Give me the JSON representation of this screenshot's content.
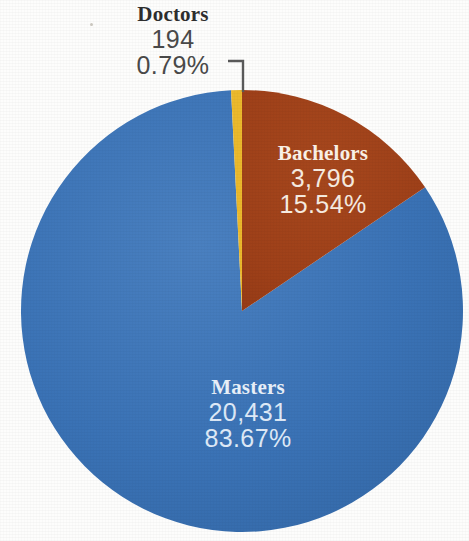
{
  "chart_data": {
    "type": "pie",
    "title": "",
    "subtitle": "",
    "xlabel": "",
    "ylabel": "",
    "legend_position": "none",
    "grid": false,
    "total": 24421,
    "start_angle_deg": 0,
    "direction": "clockwise",
    "categories": [
      "Bachelors",
      "Masters",
      "Doctors"
    ],
    "values": [
      3796,
      20431,
      194
    ],
    "percentages": [
      15.54,
      83.67,
      0.79
    ],
    "colors": [
      "#9e4019",
      "#3a72b5",
      "#ebb92c"
    ],
    "slices": [
      {
        "name": "Bachelors",
        "value": 3796,
        "value_text": "3,796",
        "percent": 15.54,
        "percent_text": "15.54%",
        "color": "#9e4019",
        "label_placement": "inside",
        "label_color": "#fbf2e8"
      },
      {
        "name": "Masters",
        "value": 20431,
        "value_text": "20,431",
        "percent": 83.67,
        "percent_text": "83.67%",
        "color": "#3a72b5",
        "label_placement": "inside",
        "label_color": "#e9f1fa"
      },
      {
        "name": "Doctors",
        "value": 194,
        "value_text": "194",
        "percent": 0.79,
        "percent_text": "0.79%",
        "color": "#ebb92c",
        "label_placement": "outside-callout",
        "label_color": "#2e2e2e",
        "has_leader_line": true
      }
    ]
  },
  "geometry": {
    "center_x": 242,
    "center_y": 311,
    "radius": 221,
    "clipped_right": true,
    "clipped_bottom": true
  },
  "labels": {
    "doctors": {
      "name": "Doctors",
      "value": "194",
      "percent": "0.79%"
    },
    "bachelors": {
      "name": "Bachelors",
      "value": "3,796",
      "percent": "15.54%"
    },
    "masters": {
      "name": "Masters",
      "value": "20,431",
      "percent": "83.67%"
    }
  },
  "colors": {
    "background": "#fdfdfc",
    "masters_blue": "#3a72b5",
    "bachelors_red": "#9e4019",
    "doctors_yellow": "#ebb92c",
    "leader_line": "#5a5a5a",
    "dark_text": "#2e2e2e"
  }
}
